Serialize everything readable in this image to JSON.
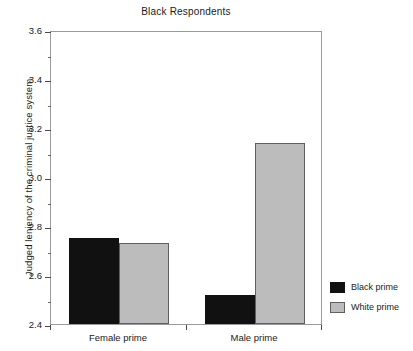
{
  "chart_data": {
    "type": "bar",
    "title": "Black Respondents",
    "xlabel": "",
    "ylabel": "Judged leniency of the criminal justice system",
    "categories": [
      "Female prime",
      "Male prime"
    ],
    "series": [
      {
        "name": "Black prime",
        "color": "#111111",
        "values": [
          2.75,
          2.52
        ]
      },
      {
        "name": "White prime",
        "color": "#bcbcbc",
        "values": [
          2.73,
          3.14
        ]
      }
    ],
    "ylim": [
      2.4,
      3.6
    ],
    "y_major_ticks": [
      "2.4",
      "2.6",
      "2.8",
      "3.0",
      "3.2",
      "3.4",
      "3.6"
    ],
    "y_minor_tick_step": 0.1,
    "grid": false,
    "legend_position": "right"
  },
  "legend": {
    "items": [
      {
        "label": "Black prime",
        "swatch": "black"
      },
      {
        "label": "White prime",
        "swatch": "gray"
      }
    ]
  }
}
